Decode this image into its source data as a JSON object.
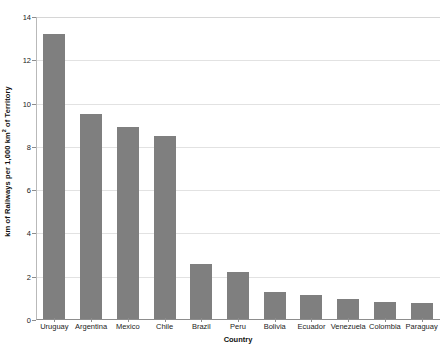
{
  "chart_data": {
    "type": "bar",
    "title": "",
    "subtitle": "",
    "xlabel": "Country",
    "ylabel": "km of Railways per 1,000 km² of Territory",
    "ylabel_parts": {
      "before": "km of Railways per 1,000 km",
      "superscript": "2",
      "after": " of Territory"
    },
    "categories": [
      "Uruguay",
      "Argentina",
      "Mexico",
      "Chile",
      "Brazil",
      "Peru",
      "Bolivia",
      "Ecuador",
      "Venezuela",
      "Colombia",
      "Paraguay"
    ],
    "values": [
      13.2,
      9.5,
      8.9,
      8.5,
      2.6,
      2.2,
      1.3,
      1.15,
      0.95,
      0.85,
      0.8
    ],
    "ylim": [
      0,
      14
    ],
    "xlim_note": "categorical",
    "yticks": [
      0,
      2,
      4,
      6,
      8,
      10,
      12,
      14
    ],
    "ytick_labels": [
      "0",
      "2",
      "4",
      "6",
      "8",
      "10",
      "12",
      "14"
    ],
    "grid": "horizontal",
    "legend": "none",
    "legend_position": "none",
    "bar_color": "#7f7f7f",
    "gridline_color": "#e2e2e2",
    "axis_color": "#8d8d8d",
    "background_color": "#ffffff",
    "text_color": "#222222"
  }
}
